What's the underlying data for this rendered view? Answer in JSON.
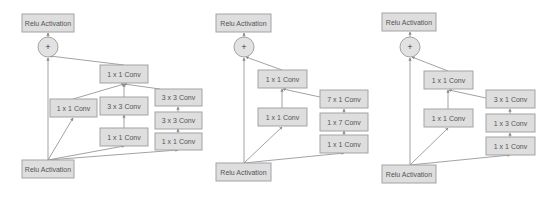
{
  "diagrams": [
    {
      "name": "inception-resnet-a",
      "nodes": {
        "relu_out": {
          "label": "Relu Activation"
        },
        "add": {
          "label": "+"
        },
        "proj": {
          "label": "1 x 1 Conv"
        },
        "b1_1x1": {
          "label": "1 x 1 Conv"
        },
        "b2_3x3": {
          "label": "3 x 3 Conv"
        },
        "b2_1x1": {
          "label": "1 x 1 Conv"
        },
        "b3_3x3_top": {
          "label": "3 x 3 Conv"
        },
        "b3_3x3_mid": {
          "label": "3 x 3 Conv"
        },
        "b3_1x1": {
          "label": "1 x 1 Conv"
        },
        "relu_in": {
          "label": "Relu Activation"
        }
      }
    },
    {
      "name": "inception-resnet-b",
      "nodes": {
        "relu_out": {
          "label": "Relu Activation"
        },
        "add": {
          "label": "+"
        },
        "proj": {
          "label": "1 x 1 Conv"
        },
        "b1_1x1": {
          "label": "1 x 1 Conv"
        },
        "b2_7x1": {
          "label": "7 x 1 Conv"
        },
        "b2_1x7": {
          "label": "1 x 7 Conv"
        },
        "b2_1x1": {
          "label": "1 x 1 Conv"
        },
        "relu_in": {
          "label": "Relu Activation"
        }
      }
    },
    {
      "name": "inception-resnet-c",
      "nodes": {
        "relu_out": {
          "label": "Relu Activation"
        },
        "add": {
          "label": "+"
        },
        "proj": {
          "label": "1 x 1 Conv"
        },
        "b1_1x1": {
          "label": "1 x 1 Conv"
        },
        "b2_3x1": {
          "label": "3 x 1 Conv"
        },
        "b2_1x3": {
          "label": "1 x 3 Conv"
        },
        "b2_1x1": {
          "label": "1 x 1 Conv"
        },
        "relu_in": {
          "label": "Relu Activation"
        }
      }
    }
  ],
  "colors": {
    "box_fill": "#dedede",
    "box_stroke": "#a3a3a3",
    "edge": "#8a8a8a",
    "text": "#555555"
  }
}
